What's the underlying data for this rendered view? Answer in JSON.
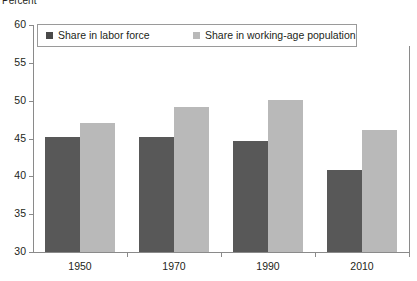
{
  "chart_data": {
    "type": "bar",
    "title": "",
    "xlabel": "",
    "ylabel": "Percent",
    "ylim": [
      30,
      60
    ],
    "yticks": [
      30,
      35,
      40,
      45,
      50,
      55,
      60
    ],
    "grid": false,
    "legend_position": "top-left",
    "categories": [
      "1950",
      "1970",
      "1990",
      "2010"
    ],
    "series": [
      {
        "name": "Share in labor force",
        "color": "#585858",
        "values": [
          45.2,
          45.2,
          44.7,
          40.9
        ]
      },
      {
        "name": "Share in working-age population",
        "color": "#b9b9b9",
        "values": [
          47.0,
          49.1,
          50.1,
          46.1
        ]
      }
    ]
  },
  "axis_unit_label": "Percent",
  "colors": {
    "series_dark": "#585858",
    "series_light": "#b9b9b9",
    "axis": "#8a8a8a",
    "text": "#231f20",
    "legend_border": "#9a9a9a",
    "background": "#ffffff"
  }
}
